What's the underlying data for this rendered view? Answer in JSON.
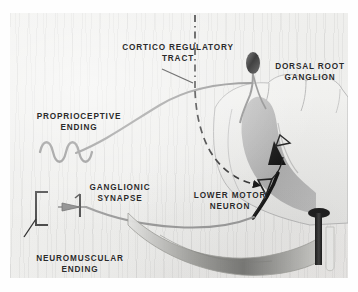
{
  "figure": {
    "title_present": false,
    "medium": "black-and-white anatomical photograph",
    "background_color": "#f1f1ef",
    "ink_color": "#2a2a2a",
    "fiber_color": "#8e8e8e",
    "gray_matter_color": "#b3b3b3"
  },
  "labels": {
    "cortico_tract": "CORTICO REGULATORY\nTRACT",
    "dorsal_root_ganglion": "DORSAL ROOT\nGANGLION",
    "proprioceptive_ending": "PROPRIOCEPTIVE\nENDING",
    "ganglionic_synapse": "GANGLIONIC\nSYNAPSE",
    "lower_motor_neuron": "LOWER MOTOR\nNEURON",
    "neuromuscular_ending": "NEUROMUSCULAR\nENDING"
  },
  "structures": [
    {
      "name": "spinal-cord-cross-section",
      "position": "right",
      "shade": "light gray outline"
    },
    {
      "name": "gray-matter-dorsal-horn",
      "position": "right-center",
      "shade": "medium gray"
    },
    {
      "name": "dorsal-root-ganglion-body",
      "position": "top-right",
      "shade": "dark oval"
    },
    {
      "name": "afferent-sensory-fiber",
      "path": "proprioceptive ending to dorsal root ganglion"
    },
    {
      "name": "efferent-motor-fiber",
      "path": "lower motor neuron to neuromuscular ending"
    },
    {
      "name": "cortico-regulatory-dashed-tract",
      "style": "dash-dot line descending into gray matter"
    },
    {
      "name": "black-directional-arrow",
      "direction": "upward into dorsal horn"
    },
    {
      "name": "proprioceptive-squiggle-receptor",
      "position": "left-center"
    },
    {
      "name": "ganglionic-synapse-symbol",
      "position": "left-lower"
    },
    {
      "name": "neuromuscular-end-plate-bracket",
      "position": "left-lower"
    },
    {
      "name": "muscle-tendon-band",
      "position": "bottom-right"
    },
    {
      "name": "dark-pin-structure",
      "position": "bottom-right"
    }
  ]
}
